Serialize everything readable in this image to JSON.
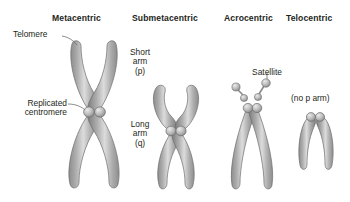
{
  "figure": {
    "title_row": {
      "metacentric": "Metacentric",
      "submetacentric": "Submetacentric",
      "acrocentric": "Acrocentric",
      "telocentric": "Telocentric"
    },
    "annotations": {
      "telomere": "Telomere",
      "replicated_centromere": "Replicated\ncentromere",
      "short_arm": "Short\narm\n(p)",
      "long_arm": "Long\narm\n(q)",
      "satellite": "Satellite",
      "no_p_arm": "(no p arm)"
    },
    "colors": {
      "background": "#ffffff",
      "text": "#231f20",
      "chromatid_dark": "#7b7b7b",
      "chromatid_mid": "#9a9a9a",
      "chromatid_light": "#c9c9c9",
      "chromatid_highlight": "#e6e6e6",
      "centromere": "#b4b4b4",
      "outline": "#6d6d6d",
      "leader_line": "#6d6d6d"
    },
    "chromosomes": [
      {
        "name": "metacentric",
        "centromere_position": "middle",
        "short_arm_length": "equal",
        "long_arm_length": "equal",
        "satellites": 0,
        "shape": "X"
      },
      {
        "name": "submetacentric",
        "centromere_position": "off-center",
        "short_arm_length": "short",
        "long_arm_length": "long",
        "satellites": 0,
        "shape": "unequal-X"
      },
      {
        "name": "acrocentric",
        "centromere_position": "near-end",
        "short_arm_length": "very short",
        "long_arm_length": "long",
        "satellites": 2,
        "shape": "V-with-satellites"
      },
      {
        "name": "telocentric",
        "centromere_position": "terminal",
        "short_arm_length": "absent",
        "long_arm_length": "long",
        "satellites": 0,
        "shape": "inverted-U"
      }
    ]
  }
}
